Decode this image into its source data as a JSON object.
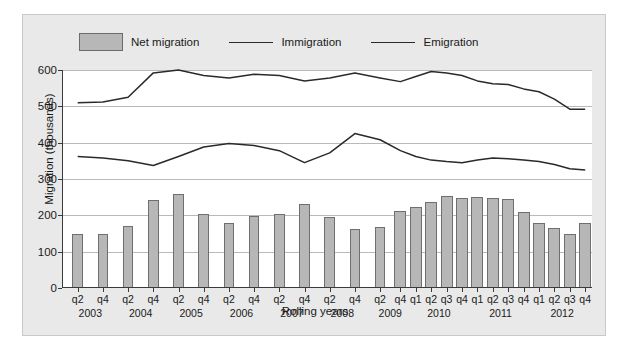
{
  "chart_data": {
    "type": "bar",
    "title": "",
    "xlabel": "Rolling years",
    "ylabel": "Migration (thousands)",
    "ylim": [
      0,
      600
    ],
    "yticks": [
      0,
      100,
      200,
      300,
      400,
      500,
      600
    ],
    "grid": true,
    "legend_position": "top",
    "categories": [
      "q2 2003",
      "q4 2003",
      "q2 2004",
      "q4 2004",
      "q2 2005",
      "q4 2005",
      "q2 2006",
      "q4 2006",
      "q2 2007",
      "q4 2007",
      "q2 2008",
      "q4 2008",
      "q2 2009",
      "q4 2009",
      "q1 2010",
      "q2 2010",
      "q3 2010",
      "q4 2010",
      "q1 2011",
      "q2 2011",
      "q3 2011",
      "q4 2011",
      "q1 2012",
      "q2 2012",
      "q3 2012",
      "q4 2012"
    ],
    "series": [
      {
        "name": "Net migration",
        "type": "bar",
        "color": "#b7b7b7",
        "values": [
          148,
          148,
          172,
          243,
          258,
          205,
          180,
          198,
          205,
          230,
          195,
          163,
          167,
          212,
          222,
          238,
          252,
          248,
          250,
          248,
          245,
          210,
          178,
          165,
          150,
          178
        ]
      },
      {
        "name": "Immigration",
        "type": "line",
        "color": "#2a2a2a",
        "values": [
          510,
          512,
          525,
          592,
          600,
          585,
          578,
          588,
          585,
          570,
          578,
          592,
          578,
          568,
          582,
          596,
          592,
          585,
          570,
          562,
          560,
          548,
          540,
          520,
          492,
          492
        ]
      },
      {
        "name": "Emigration",
        "type": "line",
        "color": "#2a2a2a",
        "values": [
          362,
          358,
          350,
          337,
          362,
          388,
          398,
          392,
          378,
          345,
          372,
          425,
          408,
          378,
          362,
          352,
          348,
          345,
          352,
          358,
          356,
          352,
          348,
          340,
          328,
          325
        ]
      }
    ],
    "legend": [
      {
        "label": "Net migration",
        "marker": "swatch"
      },
      {
        "label": "Immigration",
        "marker": "line"
      },
      {
        "label": "Emigration",
        "marker": "line"
      }
    ],
    "x_tick_labels": [
      {
        "text": "q2",
        "index": 0
      },
      {
        "text": "q4",
        "index": 1
      },
      {
        "text": "q2",
        "index": 2
      },
      {
        "text": "q4",
        "index": 3
      },
      {
        "text": "q2",
        "index": 4
      },
      {
        "text": "q4",
        "index": 5
      },
      {
        "text": "q2",
        "index": 6
      },
      {
        "text": "q4",
        "index": 7
      },
      {
        "text": "q2",
        "index": 8
      },
      {
        "text": "q4",
        "index": 9
      },
      {
        "text": "q2",
        "index": 10
      },
      {
        "text": "q4",
        "index": 11
      },
      {
        "text": "q2",
        "index": 12
      },
      {
        "text": "q4",
        "index": 13
      },
      {
        "text": "q1",
        "index": 14
      },
      {
        "text": "q2",
        "index": 15
      },
      {
        "text": "q3",
        "index": 16
      },
      {
        "text": "q4",
        "index": 17
      },
      {
        "text": "q1",
        "index": 18
      },
      {
        "text": "q2",
        "index": 19
      },
      {
        "text": "q3",
        "index": 20
      },
      {
        "text": "q4",
        "index": 21
      },
      {
        "text": "q1",
        "index": 22
      },
      {
        "text": "q2",
        "index": 23
      },
      {
        "text": "q3",
        "index": 24
      },
      {
        "text": "q4",
        "index": 25
      }
    ],
    "x_year_labels": [
      {
        "text": "2003",
        "index": 0.5
      },
      {
        "text": "2004",
        "index": 2.5
      },
      {
        "text": "2005",
        "index": 4.5
      },
      {
        "text": "2006",
        "index": 6.5
      },
      {
        "text": "2007",
        "index": 8.5
      },
      {
        "text": "2008",
        "index": 10.5
      },
      {
        "text": "2009",
        "index": 12.5
      },
      {
        "text": "2010",
        "index": 15.5
      },
      {
        "text": "2011",
        "index": 19.5
      },
      {
        "text": "2012",
        "index": 23.5
      }
    ]
  }
}
